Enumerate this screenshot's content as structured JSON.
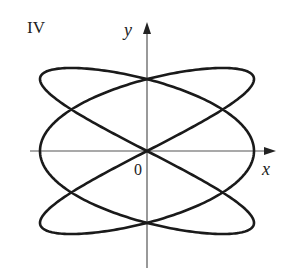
{
  "figure": {
    "panel_label": "IV",
    "x_axis_label": "x",
    "y_axis_label": "y",
    "origin_label": "0"
  },
  "colors": {
    "curve": "#1a1a1a",
    "axis": "#555555",
    "background": "#ffffff"
  },
  "chart_data": {
    "type": "parametric-curve",
    "title": "IV",
    "x_expr": "cos(3t)",
    "y_expr": "sin(2t)",
    "t_range": [
      0,
      6.283185
    ],
    "xlabel": "x",
    "ylabel": "y",
    "origin_label": "0",
    "xlim": [
      -1.1,
      1.1
    ],
    "ylim": [
      -1.1,
      1.1
    ],
    "grid": false,
    "axes_through_origin": true
  },
  "layout": {
    "origin_px": [
      147,
      151
    ],
    "scale_px": [
      107,
      83
    ],
    "x_axis_px": [
      30,
      276
    ],
    "y_axis_px": [
      22,
      268
    ]
  }
}
